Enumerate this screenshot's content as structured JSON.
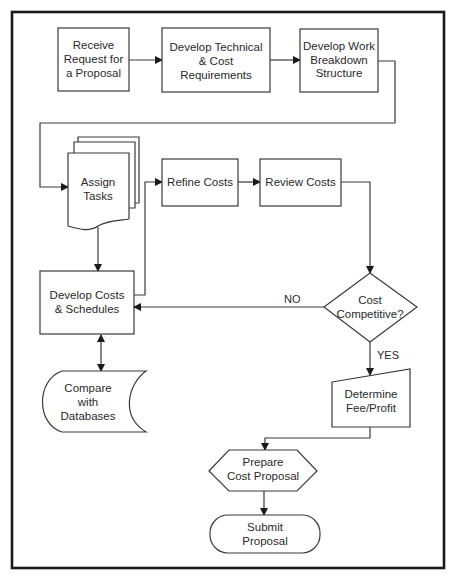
{
  "diagram": {
    "type": "flowchart",
    "nodes": {
      "receive": {
        "shape": "process",
        "lines": [
          "Receive",
          "Request for",
          "a Proposal"
        ]
      },
      "develop_tech": {
        "shape": "process",
        "lines": [
          "Develop Technical",
          "& Cost",
          "Requirements"
        ]
      },
      "wbs": {
        "shape": "process",
        "lines": [
          "Develop Work",
          "Breakdown",
          "Structure"
        ]
      },
      "assign": {
        "shape": "multi-document",
        "lines": [
          "Assign",
          "Tasks"
        ]
      },
      "refine": {
        "shape": "process",
        "lines": [
          "Refine Costs"
        ]
      },
      "review": {
        "shape": "process",
        "lines": [
          "Review Costs"
        ]
      },
      "develop_costs": {
        "shape": "process",
        "lines": [
          "Develop Costs",
          "& Schedules"
        ]
      },
      "decision": {
        "shape": "decision",
        "lines": [
          "Cost",
          "Competitive?"
        ]
      },
      "compare": {
        "shape": "stored-data",
        "lines": [
          "Compare",
          "with",
          "Databases"
        ]
      },
      "fee": {
        "shape": "manual-input",
        "lines": [
          "Determine",
          "Fee/Profit"
        ]
      },
      "prepare": {
        "shape": "preparation",
        "lines": [
          "Prepare",
          "Cost Proposal"
        ]
      },
      "submit": {
        "shape": "terminator",
        "lines": [
          "Submit",
          "Proposal"
        ]
      }
    },
    "edges": [
      {
        "from": "receive",
        "to": "develop_tech"
      },
      {
        "from": "develop_tech",
        "to": "wbs"
      },
      {
        "from": "wbs",
        "to": "assign"
      },
      {
        "from": "assign",
        "to": "develop_costs"
      },
      {
        "from": "develop_costs",
        "to": "refine"
      },
      {
        "from": "refine",
        "to": "review"
      },
      {
        "from": "review",
        "to": "decision"
      },
      {
        "from": "decision",
        "to": "develop_costs",
        "label": "NO"
      },
      {
        "from": "decision",
        "to": "fee",
        "label": "YES"
      },
      {
        "from": "develop_costs",
        "to": "compare",
        "bidirectional": true
      },
      {
        "from": "fee",
        "to": "prepare"
      },
      {
        "from": "prepare",
        "to": "submit"
      }
    ],
    "edge_labels": {
      "no": "NO",
      "yes": "YES"
    }
  }
}
